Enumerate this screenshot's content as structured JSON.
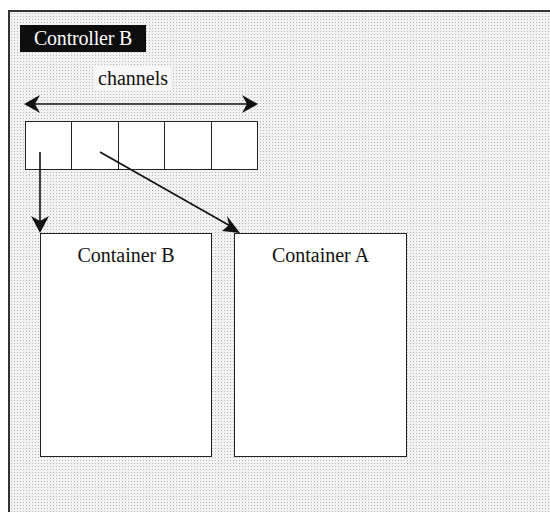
{
  "diagram": {
    "controller_label": "Controller B",
    "channels_label": "channels",
    "channel_count": 5,
    "containers": [
      {
        "id": "B",
        "label": "Container B"
      },
      {
        "id": "A",
        "label": "Container A"
      }
    ],
    "connections": [
      {
        "from_channel": 1,
        "to": "Container B"
      },
      {
        "from_channel": 2,
        "to": "Container A"
      }
    ],
    "colors": {
      "label_bg": "#0d0d0d",
      "label_text": "#ffffff",
      "line": "#222222",
      "background_pattern": "#b8b8b8"
    }
  }
}
